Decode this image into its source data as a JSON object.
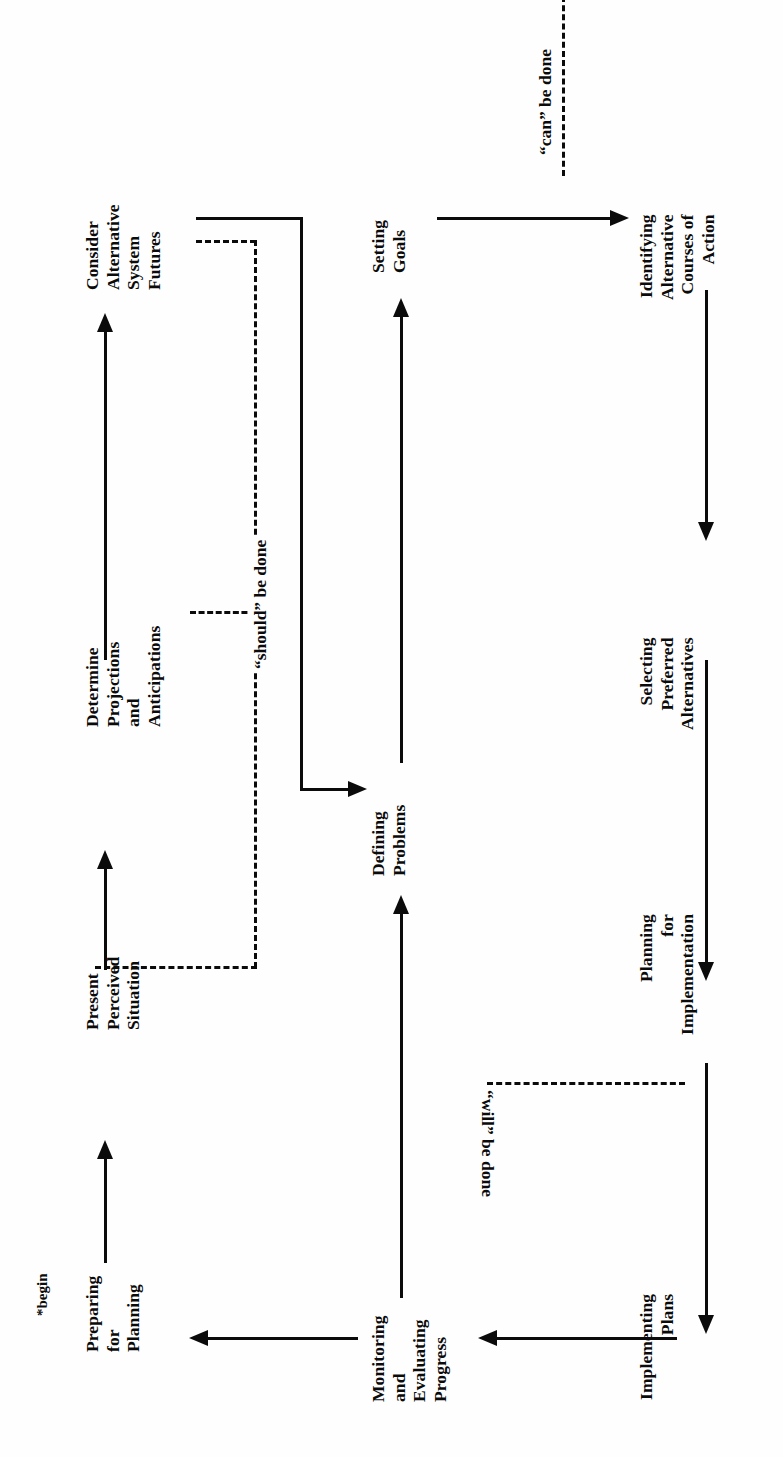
{
  "diagram": {
    "orientation": "rotated-90-ccw",
    "begin_marker": "*begin",
    "nodes": [
      {
        "id": "preparing-for-planning",
        "lines": [
          "Preparing",
          "for",
          "Planning"
        ]
      },
      {
        "id": "present-perceived-situation",
        "lines": [
          "Present",
          "Perceived",
          "Situation"
        ]
      },
      {
        "id": "determine-projections-and-anticipations",
        "lines": [
          "Determine",
          "Projections",
          "and",
          "Anticipations"
        ]
      },
      {
        "id": "consider-alternative-system-futures",
        "lines": [
          "Consider",
          "Alternative",
          "System",
          "Futures"
        ]
      },
      {
        "id": "defining-problems",
        "lines": [
          "Defining",
          "Problems"
        ]
      },
      {
        "id": "setting-goals",
        "lines": [
          "Setting",
          "Goals"
        ]
      },
      {
        "id": "identifying-alternative-courses-of-action",
        "lines": [
          "Identifying",
          "Alternative",
          "Courses of",
          "Action"
        ]
      },
      {
        "id": "selecting-preferred-alternatives",
        "lines": [
          "Selecting",
          "Preferred",
          "Alternatives"
        ]
      },
      {
        "id": "planning-for-implementation",
        "lines": [
          "Planning",
          "for",
          "Implementation"
        ]
      },
      {
        "id": "implementing-plans",
        "lines": [
          "Implementing",
          "Plans"
        ]
      },
      {
        "id": "monitoring-and-evaluating-progress",
        "lines": [
          "Monitoring",
          "and",
          "Evaluating",
          "Progress"
        ]
      }
    ],
    "boundary_labels": [
      {
        "id": "can-be-done",
        "text": "“can” be done"
      },
      {
        "id": "should-be-done",
        "text": "“should” be done"
      },
      {
        "id": "will-be-done",
        "text": "“will” be done"
      }
    ],
    "colors": {
      "ink": "#0b0b0b",
      "paper": "#fefefe"
    }
  }
}
